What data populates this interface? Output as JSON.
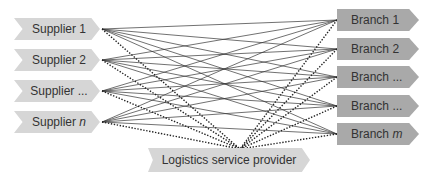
{
  "suppliers": [
    {
      "label": "Supplier 1",
      "base": "Supplier",
      "suffix": "1",
      "italic": false
    },
    {
      "label": "Supplier 2",
      "base": "Supplier",
      "suffix": "2",
      "italic": false
    },
    {
      "label": "Supplier ...",
      "base": "Supplier",
      "suffix": "...",
      "italic": false
    },
    {
      "label": "Supplier n",
      "base": "Supplier",
      "suffix": "n",
      "italic": true
    }
  ],
  "branches": [
    {
      "label": "Branch 1",
      "base": "Branch",
      "suffix": "1",
      "italic": false
    },
    {
      "label": "Branch 2",
      "base": "Branch",
      "suffix": "2",
      "italic": false
    },
    {
      "label": "Branch ...",
      "base": "Branch",
      "suffix": "...",
      "italic": false
    },
    {
      "label": "Branch ...",
      "base": "Branch",
      "suffix": "...",
      "italic": false
    },
    {
      "label": "Branch m",
      "base": "Branch",
      "suffix": "m",
      "italic": true
    }
  ],
  "provider": {
    "label": "Logistics service provider"
  },
  "colors": {
    "supplier_fill": "#d6d6d6",
    "branch_fill": "#a9a9a9",
    "provider_fill": "#d6d6d6",
    "line": "#333333"
  }
}
